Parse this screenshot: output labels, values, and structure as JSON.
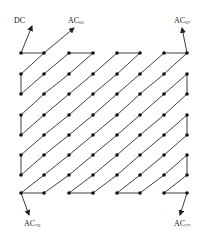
{
  "diagram": {
    "grid": {
      "cols_x": [
        21,
        44,
        69,
        93,
        117,
        140,
        164,
        187
      ],
      "rows_y": [
        53,
        74,
        94,
        115,
        135,
        155,
        175,
        193
      ]
    },
    "colors": {
      "line": "#2a2a2a",
      "dot": "#111111"
    },
    "labels": [
      {
        "id": "dc",
        "main": "DC",
        "sub": "",
        "x": 14,
        "y": 17
      },
      {
        "id": "ac01",
        "main": "AC",
        "sub": "01",
        "x": 68,
        "y": 17
      },
      {
        "id": "ac07",
        "main": "AC",
        "sub": "07",
        "x": 174,
        "y": 17
      },
      {
        "id": "ac70",
        "main": "AC",
        "sub": "70",
        "x": 24,
        "y": 220
      },
      {
        "id": "ac77",
        "main": "AC",
        "sub": "77",
        "x": 174,
        "y": 220
      }
    ],
    "arrows": [
      {
        "from": [
          0,
          0
        ],
        "to": [
          32,
          26
        ]
      },
      {
        "from": [
          1,
          0
        ],
        "to": [
          74,
          28
        ]
      },
      {
        "from": [
          7,
          0
        ],
        "to": [
          182,
          28
        ]
      },
      {
        "from": [
          0,
          7
        ],
        "to": [
          29,
          215
        ]
      },
      {
        "from": [
          7,
          7
        ],
        "to": [
          180,
          215
        ]
      }
    ]
  }
}
